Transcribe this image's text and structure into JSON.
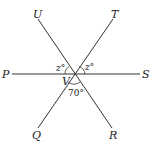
{
  "diagram": {
    "points": {
      "P": "P",
      "S": "S",
      "U": "U",
      "T": "T",
      "Q": "Q",
      "R": "R",
      "V": "V"
    },
    "angles": {
      "left_upper": "z°",
      "right_upper": "z°",
      "bottom": "70°"
    },
    "line_color": "#333333"
  }
}
